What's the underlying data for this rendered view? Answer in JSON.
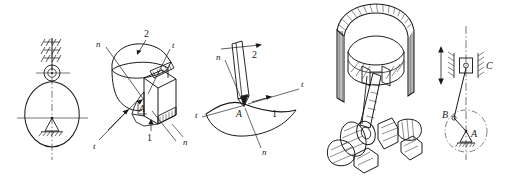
{
  "figure_strip": {
    "background_color": "#ffffff",
    "line_color": "#1a1a1a",
    "panel_count": 5,
    "panels": [
      {
        "id": "panel-cam-mechanism",
        "name": "cam-with-roller-follower",
        "labels": []
      },
      {
        "id": "panel-spatial-contact",
        "name": "spatial-higher-pair-contact",
        "labels": [
          {
            "key": "label_n_upper_left",
            "text": "n"
          },
          {
            "key": "label_t_upper_right",
            "text": "t"
          },
          {
            "key": "label_two",
            "text": "2"
          },
          {
            "key": "label_one",
            "text": "1"
          },
          {
            "key": "label_A",
            "text": "A"
          },
          {
            "key": "label_t_lower_left",
            "text": "t"
          },
          {
            "key": "label_n_lower_right",
            "text": "n"
          }
        ]
      },
      {
        "id": "panel-planar-contact",
        "name": "point-contact-normal-tangent",
        "labels": [
          {
            "key": "label_n_top",
            "text": "n"
          },
          {
            "key": "label_two",
            "text": "2"
          },
          {
            "key": "label_t_right",
            "text": "t"
          },
          {
            "key": "label_t_left",
            "text": "t"
          },
          {
            "key": "label_A",
            "text": "A"
          },
          {
            "key": "label_one",
            "text": "1"
          },
          {
            "key": "label_n_bottom",
            "text": "n"
          }
        ]
      },
      {
        "id": "panel-engine-assembly",
        "name": "piston-connecting-rod-crankshaft-cutaway",
        "labels": []
      },
      {
        "id": "panel-kinematic-diagram",
        "name": "slider-crank-kinematic-diagram",
        "labels": [
          {
            "key": "label_C",
            "text": "C"
          },
          {
            "key": "label_B",
            "text": "B"
          },
          {
            "key": "label_A",
            "text": "A"
          }
        ]
      }
    ]
  },
  "panel1": {},
  "panel2": {
    "n_upper": "n",
    "t_upper": "t",
    "two": "2",
    "one": "1",
    "A": "A",
    "t_lower": "t",
    "n_lower": "n"
  },
  "panel3": {
    "n_top": "n",
    "two": "2",
    "t_right": "t",
    "t_left": "t",
    "A": "A",
    "one": "1",
    "n_bottom": "n"
  },
  "panel4": {},
  "panel5": {
    "C": "C",
    "B": "B",
    "A": "A"
  }
}
